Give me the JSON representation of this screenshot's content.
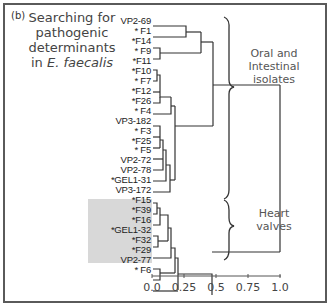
{
  "panel": {
    "label": "(b)",
    "title_line1": "Searching for",
    "title_line2": "pathogenic",
    "title_line3": "determinants",
    "title_line4_prefix": "in ",
    "title_line4_italic": "E. faecalis"
  },
  "leaves": [
    {
      "label": "VP2-69",
      "starred": false,
      "y": 26
    },
    {
      "label": "* F1",
      "starred": true,
      "y": 37
    },
    {
      "label": "*F14",
      "starred": true,
      "y": 48
    },
    {
      "label": "* F9",
      "starred": true,
      "y": 59
    },
    {
      "label": "*F11",
      "starred": true,
      "y": 70
    },
    {
      "label": "*F10",
      "starred": true,
      "y": 81
    },
    {
      "label": "* F7",
      "starred": true,
      "y": 92
    },
    {
      "label": "*F12",
      "starred": true,
      "y": 103
    },
    {
      "label": "*F26",
      "starred": true,
      "y": 114
    },
    {
      "label": "* F4",
      "starred": true,
      "y": 126
    },
    {
      "label": "VP3-182",
      "starred": false,
      "y": 137
    },
    {
      "label": "* F3",
      "starred": true,
      "y": 148
    },
    {
      "label": "*F25",
      "starred": true,
      "y": 159
    },
    {
      "label": "* F5",
      "starred": true,
      "y": 170
    },
    {
      "label": "VP2-72",
      "starred": false,
      "y": 181
    },
    {
      "label": "VP2-78",
      "starred": false,
      "y": 192
    },
    {
      "label": "*GEL1-31",
      "starred": true,
      "y": 203
    },
    {
      "label": "VP3-172",
      "starred": false,
      "y": 214
    },
    {
      "label": "*F15",
      "starred": true,
      "y": 225
    },
    {
      "label": "*F39",
      "starred": true,
      "y": 236
    },
    {
      "label": "*F16",
      "starred": true,
      "y": 247
    },
    {
      "label": "*GEL1-32",
      "starred": true,
      "y": 258
    },
    {
      "label": "*F32",
      "starred": true,
      "y": 269
    },
    {
      "label": "*F29",
      "starred": true,
      "y": 280
    },
    {
      "label": "VP2-77",
      "starred": false,
      "y": 291
    },
    {
      "label": "* F6",
      "starred": true,
      "y": 302
    }
  ],
  "groups": [
    {
      "label_line1": "Oral and",
      "label_line2": "Intestinal",
      "label_line3": "isolates"
    },
    {
      "label_line1": "Heart",
      "label_line2": "valves"
    }
  ],
  "axis": {
    "ticks": [
      "0.0",
      "0.25",
      "0.5",
      "0.75",
      "1.0"
    ],
    "tick_values": [
      0.0,
      0.25,
      0.5,
      0.75,
      1.0
    ]
  },
  "colors": {
    "line": "#333333",
    "shade": "#d8d8d8",
    "frame": "#5a5a5a",
    "text": "#444444"
  }
}
